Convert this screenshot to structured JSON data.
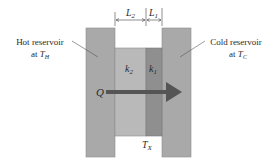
{
  "diagram": {
    "left_label": {
      "line1": "Hot reservoir",
      "line2_prefix": "at ",
      "symbol": "T",
      "subscript": "H"
    },
    "right_label": {
      "line1": "Cold reservoir",
      "line2_prefix": "at ",
      "symbol": "T",
      "subscript": "C"
    },
    "dimensions": [
      {
        "symbol": "L",
        "subscript": "2"
      },
      {
        "symbol": "L",
        "subscript": "1"
      }
    ],
    "slabs": [
      {
        "symbol": "k",
        "subscript": "2"
      },
      {
        "symbol": "k",
        "subscript": "1"
      }
    ],
    "heat_flow": {
      "symbol": "Q"
    },
    "interface_temp": {
      "symbol": "T",
      "subscript": "X"
    },
    "colors": {
      "reservoir": "#a9a9a9",
      "slab_k2": "#b9b9b9",
      "slab_k1": "#8f8f8f",
      "arrow": "#555555",
      "outline": "#808080"
    }
  }
}
